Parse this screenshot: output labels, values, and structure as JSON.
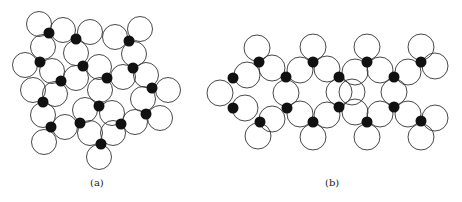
{
  "figure": {
    "panels": [
      {
        "label": "(a)",
        "label_pos": [
          98,
          184
        ],
        "description": "random packing of open circles with black dots at contact points",
        "circle_radius": 12.5,
        "circles": [
          [
            39,
            24
          ],
          [
            63,
            30
          ],
          [
            90,
            32
          ],
          [
            115,
            37
          ],
          [
            140,
            29
          ],
          [
            43,
            47
          ],
          [
            76,
            53
          ],
          [
            134,
            54
          ],
          [
            25,
            65
          ],
          [
            52,
            71
          ],
          [
            99,
            67
          ],
          [
            123,
            77
          ],
          [
            146,
            75
          ],
          [
            168,
            90
          ],
          [
            76,
            78
          ],
          [
            33,
            90
          ],
          [
            100,
            90
          ],
          [
            55,
            94
          ],
          [
            143,
            99
          ],
          [
            43,
            115
          ],
          [
            85,
            110
          ],
          [
            112,
            113
          ],
          [
            135,
            122
          ],
          [
            160,
            118
          ],
          [
            65,
            127
          ],
          [
            90,
            133
          ],
          [
            113,
            133
          ],
          [
            44,
            142
          ],
          [
            99,
            157
          ]
        ],
        "dots": [
          [
            49,
            33
          ],
          [
            76,
            39
          ],
          [
            129,
            41
          ],
          [
            40,
            62
          ],
          [
            83,
            66
          ],
          [
            133,
            68
          ],
          [
            61,
            81
          ],
          [
            107,
            78
          ],
          [
            152,
            88
          ],
          [
            43,
            102
          ],
          [
            99,
            106
          ],
          [
            146,
            114
          ],
          [
            51,
            127
          ],
          [
            80,
            123
          ],
          [
            121,
            124
          ],
          [
            101,
            144
          ]
        ]
      },
      {
        "label": "(b)",
        "label_pos": [
          333,
          184
        ],
        "description": "ordered chain packing of open circles with black dots at contact points",
        "circle_radius": 13,
        "circles": [
          [
            257,
            48
          ],
          [
            247,
            75
          ],
          [
            272,
            68
          ],
          [
            220,
            93
          ],
          [
            245,
            108
          ],
          [
            272,
            119
          ],
          [
            258,
            136
          ],
          [
            300,
            70
          ],
          [
            286,
            93
          ],
          [
            300,
            114
          ],
          [
            313,
            47
          ],
          [
            327,
            69
          ],
          [
            313,
            137
          ],
          [
            327,
            115
          ],
          [
            339,
            92
          ],
          [
            352,
            92
          ],
          [
            367,
            47
          ],
          [
            355,
            72
          ],
          [
            380,
            70
          ],
          [
            394,
            92
          ],
          [
            380,
            114
          ],
          [
            355,
            112
          ],
          [
            367,
            137
          ],
          [
            421,
            47
          ],
          [
            408,
            72
          ],
          [
            435,
            66
          ],
          [
            408,
            114
          ],
          [
            435,
            118
          ],
          [
            421,
            137
          ]
        ],
        "dots": [
          [
            259,
            62
          ],
          [
            233,
            78
          ],
          [
            286,
            77
          ],
          [
            233,
            108
          ],
          [
            287,
            108
          ],
          [
            260,
            122
          ],
          [
            313,
            62
          ],
          [
            313,
            122
          ],
          [
            339,
            77
          ],
          [
            339,
            107
          ],
          [
            367,
            62
          ],
          [
            394,
            77
          ],
          [
            421,
            62
          ],
          [
            367,
            122
          ],
          [
            394,
            107
          ],
          [
            421,
            121
          ]
        ]
      }
    ]
  }
}
